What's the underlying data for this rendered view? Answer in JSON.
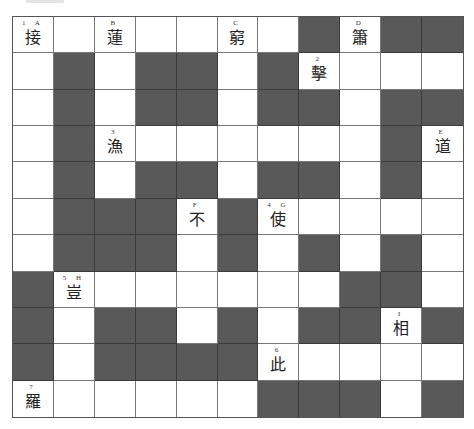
{
  "puzzle": {
    "rows": 11,
    "cols": 11,
    "colors": {
      "block": "#595959",
      "empty": "#ffffff",
      "gridline": "#777777"
    },
    "layout": [
      "WWWWWWWBWBB",
      "WBWBBWBWWWW",
      "WBWBBWBBWBB",
      "WBWWWWWWWBW",
      "WBWBBWBBWBW",
      "WBBBWBWWWWW",
      "WBBBWBWBWBW",
      "BWWWWWWWBBW",
      "BWBBWBWBBWB",
      "BWBBBBWWWWW",
      "WWWWWWBBBWB"
    ],
    "cells": [
      {
        "row": 0,
        "col": 0,
        "label": "1 A",
        "char": "接"
      },
      {
        "row": 0,
        "col": 2,
        "label": "B",
        "char": "蓮"
      },
      {
        "row": 0,
        "col": 5,
        "label": "C",
        "char": "窮"
      },
      {
        "row": 0,
        "col": 8,
        "label": "D",
        "char": "簫"
      },
      {
        "row": 1,
        "col": 7,
        "label": "2",
        "char": "擊"
      },
      {
        "row": 3,
        "col": 2,
        "label": "3",
        "char": "漁"
      },
      {
        "row": 3,
        "col": 10,
        "label": "E",
        "char": "道"
      },
      {
        "row": 5,
        "col": 4,
        "label": "F",
        "char": "不"
      },
      {
        "row": 5,
        "col": 6,
        "label": "4 G",
        "char": "使"
      },
      {
        "row": 7,
        "col": 1,
        "label": "5 H",
        "char": "豈"
      },
      {
        "row": 8,
        "col": 9,
        "label": "I",
        "char": "相"
      },
      {
        "row": 9,
        "col": 6,
        "label": "6",
        "char": "此"
      },
      {
        "row": 10,
        "col": 0,
        "label": "7",
        "char": "羅"
      }
    ]
  }
}
